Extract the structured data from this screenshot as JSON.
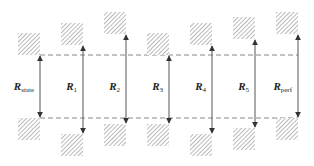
{
  "diagram": {
    "reference_lines": [
      "upper-reference",
      "lower-reference"
    ],
    "columns": [
      {
        "id": "state",
        "label_main": "R",
        "label_sub": "state",
        "upper_offset": 0,
        "lower_offset": 0
      },
      {
        "id": "r1",
        "label_main": "R",
        "label_sub": "1",
        "upper_offset": 10,
        "lower_offset": 16
      },
      {
        "id": "r2",
        "label_main": "R",
        "label_sub": "2",
        "upper_offset": 21,
        "lower_offset": 6
      },
      {
        "id": "r3",
        "label_main": "R",
        "label_sub": "3",
        "upper_offset": 0,
        "lower_offset": 6
      },
      {
        "id": "r4",
        "label_main": "R",
        "label_sub": "4",
        "upper_offset": 10,
        "lower_offset": 16
      },
      {
        "id": "r5",
        "label_main": "R",
        "label_sub": "5",
        "upper_offset": 16,
        "lower_offset": 10
      },
      {
        "id": "perf",
        "label_main": "R",
        "label_sub": "perf",
        "upper_offset": 21,
        "lower_offset": 0
      }
    ],
    "colors": {
      "line": "#555555",
      "dash": "#8a8a8a",
      "hatch": "#888888",
      "text": "#222222"
    }
  }
}
